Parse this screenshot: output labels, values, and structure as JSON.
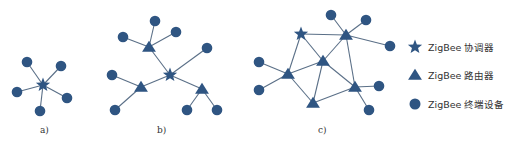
{
  "colors": {
    "node": "#2f5582",
    "edge": "#5a6f87",
    "text": "#333333"
  },
  "diagrams": [
    {
      "caption": "a)",
      "caption_pos": [
        40,
        133
      ],
      "coordinator": [
        43,
        85
      ],
      "routers": [],
      "end_devices": [
        [
          27,
          62
        ],
        [
          61,
          66
        ],
        [
          17,
          92
        ],
        [
          67,
          98
        ],
        [
          40,
          111
        ]
      ],
      "edges": [
        [
          [
            43,
            85
          ],
          [
            27,
            62
          ]
        ],
        [
          [
            43,
            85
          ],
          [
            61,
            66
          ]
        ],
        [
          [
            43,
            85
          ],
          [
            17,
            92
          ]
        ],
        [
          [
            43,
            85
          ],
          [
            67,
            98
          ]
        ],
        [
          [
            43,
            85
          ],
          [
            40,
            111
          ]
        ]
      ]
    },
    {
      "caption": "b)",
      "caption_pos": [
        157,
        133
      ],
      "coordinator": [
        170,
        75
      ],
      "routers": [
        [
          149,
          47
        ],
        [
          141,
          87
        ],
        [
          202,
          89
        ]
      ],
      "end_devices": [
        [
          155,
          21
        ],
        [
          123,
          37
        ],
        [
          176,
          32
        ],
        [
          207,
          48
        ],
        [
          112,
          75
        ],
        [
          115,
          110
        ],
        [
          187,
          110
        ],
        [
          217,
          110
        ]
      ],
      "edges": [
        [
          [
            170,
            75
          ],
          [
            149,
            47
          ]
        ],
        [
          [
            170,
            75
          ],
          [
            141,
            87
          ]
        ],
        [
          [
            170,
            75
          ],
          [
            202,
            89
          ]
        ],
        [
          [
            170,
            75
          ],
          [
            207,
            48
          ]
        ],
        [
          [
            149,
            47
          ],
          [
            155,
            21
          ]
        ],
        [
          [
            149,
            47
          ],
          [
            123,
            37
          ]
        ],
        [
          [
            149,
            47
          ],
          [
            176,
            32
          ]
        ],
        [
          [
            141,
            87
          ],
          [
            112,
            75
          ]
        ],
        [
          [
            141,
            87
          ],
          [
            115,
            110
          ]
        ],
        [
          [
            202,
            89
          ],
          [
            187,
            110
          ]
        ],
        [
          [
            202,
            89
          ],
          [
            217,
            110
          ]
        ]
      ]
    },
    {
      "caption": "c)",
      "caption_pos": [
        318,
        133
      ],
      "coordinator": [
        301,
        34
      ],
      "routers": [
        [
          346,
          35
        ],
        [
          323,
          61
        ],
        [
          288,
          74
        ],
        [
          355,
          87
        ],
        [
          313,
          103
        ]
      ],
      "end_devices": [
        [
          331,
          15
        ],
        [
          366,
          20
        ],
        [
          390,
          46
        ],
        [
          259,
          62
        ],
        [
          259,
          90
        ],
        [
          379,
          86
        ],
        [
          369,
          110
        ]
      ],
      "edges": [
        [
          [
            301,
            34
          ],
          [
            346,
            35
          ]
        ],
        [
          [
            301,
            34
          ],
          [
            323,
            61
          ]
        ],
        [
          [
            301,
            34
          ],
          [
            288,
            74
          ]
        ],
        [
          [
            346,
            35
          ],
          [
            323,
            61
          ]
        ],
        [
          [
            346,
            35
          ],
          [
            355,
            87
          ]
        ],
        [
          [
            323,
            61
          ],
          [
            288,
            74
          ]
        ],
        [
          [
            323,
            61
          ],
          [
            355,
            87
          ]
        ],
        [
          [
            323,
            61
          ],
          [
            313,
            103
          ]
        ],
        [
          [
            288,
            74
          ],
          [
            313,
            103
          ]
        ],
        [
          [
            355,
            87
          ],
          [
            313,
            103
          ]
        ],
        [
          [
            346,
            35
          ],
          [
            331,
            15
          ]
        ],
        [
          [
            346,
            35
          ],
          [
            366,
            20
          ]
        ],
        [
          [
            346,
            35
          ],
          [
            390,
            46
          ]
        ],
        [
          [
            288,
            74
          ],
          [
            259,
            62
          ]
        ],
        [
          [
            288,
            74
          ],
          [
            259,
            90
          ]
        ],
        [
          [
            355,
            87
          ],
          [
            379,
            86
          ]
        ],
        [
          [
            355,
            87
          ],
          [
            369,
            110
          ]
        ]
      ]
    }
  ],
  "legend": [
    {
      "icon": "star-icon",
      "label": "ZigBee 协调器",
      "pos": [
        415,
        47
      ]
    },
    {
      "icon": "triangle-icon",
      "label": "ZigBee 路由器",
      "pos": [
        415,
        75
      ]
    },
    {
      "icon": "circle-icon",
      "label": "ZigBee 终端设备",
      "pos": [
        415,
        104
      ]
    }
  ]
}
